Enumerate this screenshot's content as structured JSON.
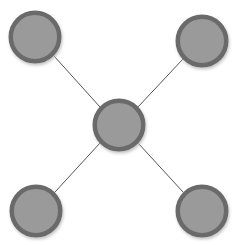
{
  "diagram": {
    "type": "node-link-graph",
    "layout": "star",
    "canvas": {
      "width": 238,
      "height": 245,
      "background_color": "#ffffff"
    },
    "style": {
      "node_fill_color": "#9a9a9a",
      "node_border_color": "#6a6a6a",
      "node_border_width": 4.5,
      "edge_color": "#555555",
      "edge_width": 1,
      "shadow_color": "#b9b9b9",
      "shadow_blur": 3,
      "shadow_offset_x": 1,
      "shadow_offset_y": 2
    },
    "nodes": [
      {
        "id": "node-top-left",
        "name": "top-left-node",
        "label": "",
        "cx": 35,
        "cy": 37,
        "r": 26.5
      },
      {
        "id": "node-top-right",
        "name": "top-right-node",
        "label": "",
        "cx": 202,
        "cy": 41,
        "r": 26.5
      },
      {
        "id": "node-center",
        "name": "center-hub-node",
        "label": "",
        "cx": 119,
        "cy": 125,
        "r": 26.5
      },
      {
        "id": "node-bottom-left",
        "name": "bottom-left-node",
        "label": "",
        "cx": 36,
        "cy": 211,
        "r": 26.5
      },
      {
        "id": "node-bottom-right",
        "name": "bottom-right-node",
        "label": "",
        "cx": 202,
        "cy": 211,
        "r": 26.5
      }
    ],
    "edges": [
      {
        "id": "edge-center-top-left",
        "name": "edge-center-to-top-left",
        "source": "node-center",
        "target": "node-top-left",
        "x1": 100,
        "y1": 107,
        "x2": 54,
        "y2": 56
      },
      {
        "id": "edge-center-top-right",
        "name": "edge-center-to-top-right",
        "source": "node-center",
        "target": "node-top-right",
        "x1": 138,
        "y1": 107,
        "x2": 183,
        "y2": 59
      },
      {
        "id": "edge-center-bottom-left",
        "name": "edge-center-to-bottom-left",
        "source": "node-center",
        "target": "node-bottom-left",
        "x1": 100,
        "y1": 143,
        "x2": 55,
        "y2": 192
      },
      {
        "id": "edge-center-bottom-right",
        "name": "edge-center-to-bottom-right",
        "source": "node-center",
        "target": "node-bottom-right",
        "x1": 138,
        "y1": 143,
        "x2": 183,
        "y2": 192
      }
    ]
  }
}
